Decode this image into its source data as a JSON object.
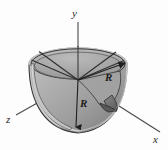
{
  "figure": {
    "background_color": "#fdfdfd"
  },
  "axes": [
    {
      "name": "y-axis",
      "label": "y",
      "direction": "up",
      "label_x": 72,
      "label_y": 17
    },
    {
      "name": "z-axis",
      "label": "z",
      "direction": "lower-left",
      "label_x": 6,
      "label_y": 121
    },
    {
      "name": "x-axis",
      "label": "x",
      "direction": "lower-right",
      "label_x": 155,
      "label_y": 141
    }
  ],
  "dimension_labels": [
    {
      "name": "radius-label-upper",
      "text": "R",
      "x": 108,
      "y": 79
    },
    {
      "name": "radius-label-lower",
      "text": "R",
      "x": 83,
      "y": 105
    }
  ],
  "colors": {
    "solid_fill_light": "#b9b9b9",
    "solid_fill_mid": "#a6a6a6",
    "solid_fill_dark": "#8d8d8d",
    "shell_edge": "#cfcfcf",
    "outline": "#3a3a3a",
    "axis_line": "#4a4a4a",
    "cut_shadow": "#5e5e5e",
    "label_color": "#1c1c1c"
  },
  "geometry": {
    "center_x": 78,
    "center_y": 80,
    "top_ellipse_rx": 49,
    "top_ellipse_ry": 16,
    "bowl_depth": 52,
    "radial_line_count": 4
  }
}
